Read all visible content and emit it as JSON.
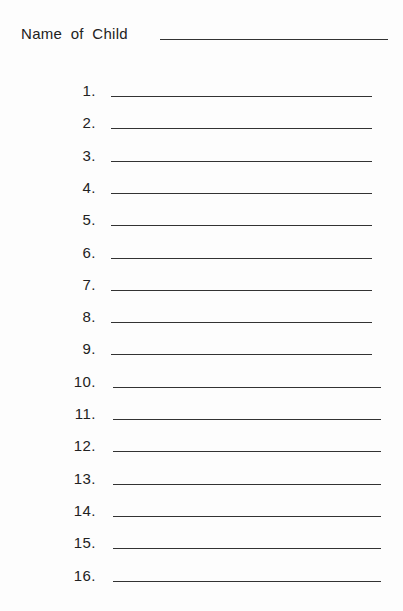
{
  "form": {
    "name_label": "Name of Child",
    "name_value": "",
    "items": [
      {
        "number": "1.",
        "value": ""
      },
      {
        "number": "2.",
        "value": ""
      },
      {
        "number": "3.",
        "value": ""
      },
      {
        "number": "4.",
        "value": ""
      },
      {
        "number": "5.",
        "value": ""
      },
      {
        "number": "6.",
        "value": ""
      },
      {
        "number": "7.",
        "value": ""
      },
      {
        "number": "8.",
        "value": ""
      },
      {
        "number": "9.",
        "value": ""
      },
      {
        "number": "10.",
        "value": ""
      },
      {
        "number": "11.",
        "value": ""
      },
      {
        "number": "12.",
        "value": ""
      },
      {
        "number": "13.",
        "value": ""
      },
      {
        "number": "14.",
        "value": ""
      },
      {
        "number": "15.",
        "value": ""
      },
      {
        "number": "16.",
        "value": ""
      }
    ]
  }
}
